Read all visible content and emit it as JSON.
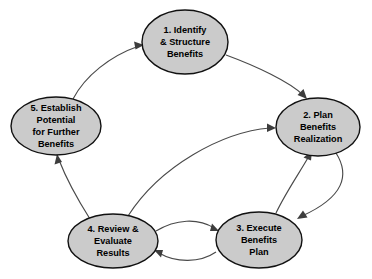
{
  "diagram": {
    "background_color": "#ffffff",
    "node_fill_color": "#cbcbcb",
    "node_stroke_color": "#111111",
    "arrow_color": "#4a4a4a",
    "text_color": "#000000",
    "nodes": [
      {
        "id": "node-1",
        "name": "identify-and-structure-benefits",
        "number": "1.",
        "lines": [
          "1. Identify",
          "& Structure",
          "Benefits"
        ],
        "line1": "1. Identify",
        "line2": "& Structure",
        "line3": "Benefits",
        "cx": 185,
        "cy": 42,
        "rx": 43,
        "ry": 32
      },
      {
        "id": "node-2",
        "name": "plan-benefits-realization",
        "number": "2.",
        "lines": [
          "2. Plan",
          "Benefits",
          "Realization"
        ],
        "line1": "2. Plan",
        "line2": "Benefits",
        "line3": "Realization",
        "cx": 318,
        "cy": 127,
        "rx": 42,
        "ry": 29
      },
      {
        "id": "node-3",
        "name": "execute-benefits-plan",
        "number": "3.",
        "lines": [
          "3. Execute",
          "Benefits",
          "Plan"
        ],
        "line1": "3. Execute",
        "line2": "Benefits",
        "line3": "Plan",
        "cx": 259,
        "cy": 240,
        "rx": 43,
        "ry": 28
      },
      {
        "id": "node-4",
        "name": "review-and-evaluate-results",
        "number": "4.",
        "lines": [
          "4. Review &",
          "Evaluate",
          "Results"
        ],
        "line1": "4. Review &",
        "line2": "Evaluate",
        "line3": "Results",
        "cx": 113,
        "cy": 241,
        "rx": 45,
        "ry": 27
      },
      {
        "id": "node-5",
        "name": "establish-potential-for-further-benefits",
        "number": "5.",
        "lines": [
          "5. Establish",
          "Potential",
          "for Further",
          "Benefits"
        ],
        "line1": "5. Establish",
        "line2": "Potential",
        "line3": "for Further",
        "line4": "Benefits",
        "cx": 56,
        "cy": 126,
        "rx": 45,
        "ry": 29
      }
    ],
    "edges": [
      {
        "name": "edge-1-to-2",
        "from": "1. Identify & Structure Benefits",
        "to": "2. Plan Benefits Realization",
        "direction": "forward"
      },
      {
        "name": "edge-2-to-3",
        "from": "2. Plan Benefits Realization",
        "to": "3. Execute Benefits Plan",
        "direction": "forward"
      },
      {
        "name": "edge-3-to-2",
        "from": "3. Execute Benefits Plan",
        "to": "2. Plan Benefits Realization",
        "direction": "forward"
      },
      {
        "name": "edge-3-to-4",
        "from": "3. Execute Benefits Plan",
        "to": "4. Review & Evaluate Results",
        "direction": "forward"
      },
      {
        "name": "edge-4-to-3",
        "from": "4. Review & Evaluate Results",
        "to": "3. Execute Benefits Plan",
        "direction": "forward"
      },
      {
        "name": "edge-4-to-2",
        "from": "4. Review & Evaluate Results",
        "to": "2. Plan Benefits Realization",
        "direction": "forward"
      },
      {
        "name": "edge-4-to-5",
        "from": "4. Review & Evaluate Results",
        "to": "5. Establish Potential for Further Benefits",
        "direction": "forward"
      },
      {
        "name": "edge-5-to-1",
        "from": "5. Establish Potential for Further Benefits",
        "to": "1. Identify & Structure Benefits",
        "direction": "forward"
      }
    ]
  }
}
